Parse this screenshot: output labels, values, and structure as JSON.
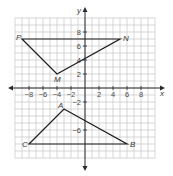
{
  "figure": {
    "type": "coordinate-grid",
    "axis_labels": {
      "x": "x",
      "y": "y"
    },
    "grid_range": {
      "xmin": -10,
      "xmax": 10,
      "ymin": -10,
      "ymax": 10
    },
    "x_tick_labels": [
      {
        "value": -8,
        "label": "−8"
      },
      {
        "value": -6,
        "label": "−6"
      },
      {
        "value": -4,
        "label": "−4"
      },
      {
        "value": -2,
        "label": "−2"
      },
      {
        "value": 2,
        "label": "2"
      },
      {
        "value": 4,
        "label": "4"
      },
      {
        "value": 6,
        "label": "6"
      },
      {
        "value": 8,
        "label": "8"
      }
    ],
    "y_tick_labels": [
      {
        "value": 8,
        "label": "8"
      },
      {
        "value": 6,
        "label": "6"
      },
      {
        "value": 4,
        "label": "4"
      },
      {
        "value": 2,
        "label": "2"
      },
      {
        "value": -2,
        "label": "−2"
      },
      {
        "value": -6,
        "label": "−6"
      }
    ],
    "triangles": [
      {
        "name": "MNP",
        "vertices": [
          {
            "label": "P",
            "x": -9,
            "y": 7
          },
          {
            "label": "N",
            "x": 5,
            "y": 7
          },
          {
            "label": "M",
            "x": -4,
            "y": 2
          }
        ]
      },
      {
        "name": "ABC",
        "vertices": [
          {
            "label": "A",
            "x": -3,
            "y": -3
          },
          {
            "label": "B",
            "x": 6,
            "y": -8
          },
          {
            "label": "C",
            "x": -8,
            "y": -8
          }
        ]
      }
    ],
    "colors": {
      "grid": "#bdbdbd",
      "axis": "#2a2a2a",
      "shape": "#1e1e1e",
      "text": "#3a3a3a"
    }
  }
}
